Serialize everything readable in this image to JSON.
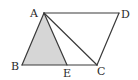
{
  "figure": {
    "type": "geometry",
    "points": {
      "A": {
        "label": "A"
      },
      "B": {
        "label": "B"
      },
      "C": {
        "label": "C"
      },
      "D": {
        "label": "D"
      },
      "E": {
        "label": "E"
      }
    },
    "segments": [
      "AB",
      "BC",
      "CD",
      "DA",
      "AE",
      "AC"
    ],
    "shaded_region": [
      "A",
      "B",
      "E"
    ],
    "colors": {
      "stroke": "#3a3a3a",
      "shade": "#d6d6d6",
      "label": "#2a2a2a",
      "background": "#ffffff"
    }
  }
}
